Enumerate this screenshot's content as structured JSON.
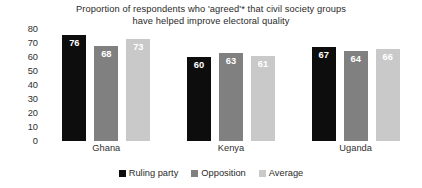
{
  "chart_data": {
    "type": "bar",
    "title": "Proportion of respondents who 'agreed'* that civil society groups have helped improve electoral quality",
    "title_lines": [
      "Proportion of respondents who 'agreed'* that civil society groups",
      "have helped improve electoral quality"
    ],
    "categories": [
      "Ghana",
      "Kenya",
      "Uganda"
    ],
    "series": [
      {
        "name": "Ruling party",
        "values": [
          76,
          60,
          67
        ],
        "color": "#0d0d0d"
      },
      {
        "name": "Opposition",
        "values": [
          68,
          63,
          64
        ],
        "color": "#808080"
      },
      {
        "name": "Average",
        "values": [
          73,
          61,
          66
        ],
        "color": "#c9c9c9"
      }
    ],
    "xlabel": "",
    "ylabel": "",
    "ylim": [
      0,
      80
    ],
    "yticks": [
      80,
      70,
      60,
      50,
      40,
      30,
      20,
      10,
      0
    ],
    "grid": false,
    "legend_position": "bottom",
    "value_labels": true
  }
}
